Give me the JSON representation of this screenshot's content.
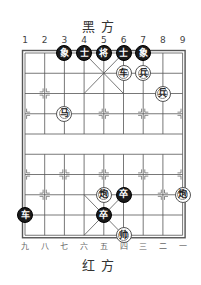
{
  "titles": {
    "top": "黑方",
    "bottom": "红方"
  },
  "column_labels_top": [
    "1",
    "2",
    "3",
    "4",
    "5",
    "6",
    "7",
    "8",
    "9"
  ],
  "column_labels_bottom": [
    "九",
    "八",
    "七",
    "六",
    "五",
    "四",
    "三",
    "二",
    "一"
  ],
  "board": {
    "files": 9,
    "ranks": 10,
    "line_color": "#555555",
    "background": "#ffffff"
  },
  "pieces": [
    {
      "side": "black",
      "char": "象",
      "file": 3,
      "rank": 0
    },
    {
      "side": "black",
      "char": "士",
      "file": 4,
      "rank": 0
    },
    {
      "side": "black",
      "char": "将",
      "file": 5,
      "rank": 0
    },
    {
      "side": "black",
      "char": "士",
      "file": 6,
      "rank": 0
    },
    {
      "side": "black",
      "char": "象",
      "file": 7,
      "rank": 0
    },
    {
      "side": "red",
      "char": "车",
      "file": 6,
      "rank": 1
    },
    {
      "side": "red",
      "char": "兵",
      "file": 7,
      "rank": 1
    },
    {
      "side": "red",
      "char": "兵",
      "file": 8,
      "rank": 2
    },
    {
      "side": "red",
      "char": "马",
      "file": 3,
      "rank": 3
    },
    {
      "side": "red",
      "char": "炮",
      "file": 5,
      "rank": 7
    },
    {
      "side": "black",
      "char": "卒",
      "file": 6,
      "rank": 7
    },
    {
      "side": "red",
      "char": "炮",
      "file": 9,
      "rank": 7
    },
    {
      "side": "black",
      "char": "车",
      "file": 1,
      "rank": 8
    },
    {
      "side": "black",
      "char": "卒",
      "file": 5,
      "rank": 8
    },
    {
      "side": "red",
      "char": "帅",
      "file": 6,
      "rank": 9
    }
  ]
}
